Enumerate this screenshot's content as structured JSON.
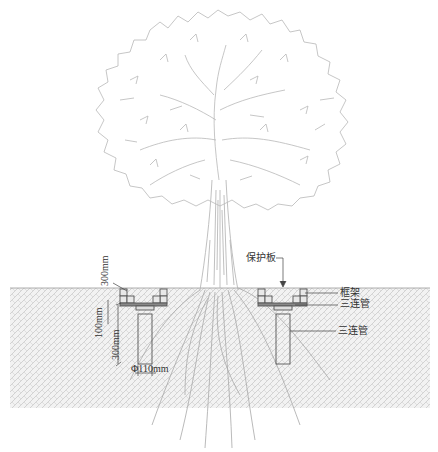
{
  "diagram": {
    "title": "",
    "colors": {
      "line": "#9a9a9a",
      "tree": "#b0b0b0",
      "soil_hatch": "#c8c8c8",
      "structure": "#555555",
      "text": "#333333",
      "background": "#ffffff"
    },
    "labels": {
      "protection_board": "保护板",
      "frame": "框架",
      "triple_pipe_top": "三连管",
      "triple_pipe_side": "三连管"
    },
    "dimensions": {
      "depth_top": "300mm",
      "depth_frame": "100mm",
      "depth_pipe": "300mm",
      "pipe_diameter": "Φ110mm"
    },
    "elements": [
      {
        "id": "tree-canopy",
        "type": "tree"
      },
      {
        "id": "tree-trunk",
        "type": "trunk"
      },
      {
        "id": "soil-layer",
        "type": "hatched-ground"
      },
      {
        "id": "left-planter-frame",
        "type": "frame"
      },
      {
        "id": "right-planter-frame",
        "type": "frame"
      },
      {
        "id": "left-pipe",
        "type": "pipe"
      },
      {
        "id": "right-pipe",
        "type": "pipe"
      },
      {
        "id": "roots",
        "type": "roots"
      }
    ]
  }
}
